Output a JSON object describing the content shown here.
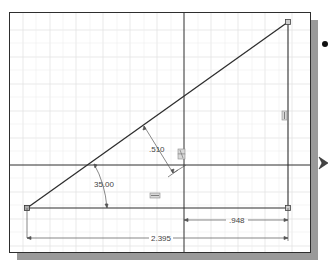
{
  "sketch": {
    "grid": {
      "color": "#e3e3e3",
      "spacing": 13.5
    },
    "axes": {
      "horizontal_y": 164,
      "vertical_x": 183,
      "color": "#2e2e2e"
    },
    "triangle": {
      "vertices": [
        [
          26,
          207
        ],
        [
          287,
          21
        ],
        [
          287,
          207
        ]
      ],
      "line_color": "#2e2e2e"
    },
    "dimensions": {
      "offset": {
        "value": ".510"
      },
      "angle": {
        "value": "35.00"
      },
      "horizontal_short": {
        "value": ".948"
      },
      "horizontal_overall": {
        "value": "2.395"
      }
    },
    "constraint_glyphs": [
      {
        "name": "vertical-constraint-icon",
        "symbol": "ǀ"
      },
      {
        "name": "horizontal-constraint-icon",
        "symbol": "═"
      },
      {
        "name": "parallel-constraint-icon",
        "symbol": "∥"
      }
    ]
  },
  "colors": {
    "frame_border": "#2e2e2e",
    "shadow": "#9a9a9a",
    "dimension": "#555555",
    "grid": "#e3e3e3"
  }
}
